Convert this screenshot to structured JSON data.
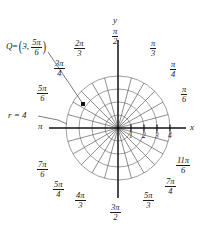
{
  "figure": {
    "type": "polar-grid-diagram",
    "background": "#ffffff",
    "ink_color": "#1a1a1a",
    "grid_color": "#6f6f6f",
    "center": {
      "x": 118,
      "y": 128
    },
    "outer_radius_px": 52,
    "ring_count": 4,
    "ring_radii_units": [
      1,
      2,
      3,
      4
    ],
    "ray_count": 24,
    "ray_step_degrees": 15
  },
  "axes": {
    "x_letter": "x",
    "y_letter": "y",
    "x_ticks": [
      "1",
      "2",
      "3",
      "4"
    ],
    "x_tick_values": [
      1,
      2,
      3,
      4
    ]
  },
  "angle_labels": [
    {
      "name": "pi-over-2",
      "num": "π",
      "den": "2",
      "deg": 90,
      "whole": null
    },
    {
      "name": "pi-over-3",
      "num": "π",
      "den": "3",
      "deg": 60,
      "whole": null
    },
    {
      "name": "pi-over-4",
      "num": "π",
      "den": "4",
      "deg": 45,
      "whole": null
    },
    {
      "name": "pi-over-6",
      "num": "π",
      "den": "6",
      "deg": 30,
      "whole": null
    },
    {
      "name": "two-pi-over-3",
      "num": "2π",
      "den": "3",
      "deg": 120,
      "whole": null
    },
    {
      "name": "three-pi-over-4",
      "num": "3π",
      "den": "4",
      "deg": 135,
      "whole": null
    },
    {
      "name": "five-pi-over-6",
      "num": "5π",
      "den": "6",
      "deg": 150,
      "whole": null
    },
    {
      "name": "pi",
      "num": null,
      "den": null,
      "deg": 180,
      "whole": "π"
    },
    {
      "name": "seven-pi-over-6",
      "num": "7π",
      "den": "6",
      "deg": 210,
      "whole": null
    },
    {
      "name": "five-pi-over-4",
      "num": "5π",
      "den": "4",
      "deg": 225,
      "whole": null
    },
    {
      "name": "four-pi-over-3",
      "num": "4π",
      "den": "3",
      "deg": 240,
      "whole": null
    },
    {
      "name": "three-pi-over-2",
      "num": "3π",
      "den": "2",
      "deg": 270,
      "whole": null
    },
    {
      "name": "five-pi-over-3",
      "num": "5π",
      "den": "3",
      "deg": 300,
      "whole": null
    },
    {
      "name": "seven-pi-over-4",
      "num": "7π",
      "den": "4",
      "deg": 315,
      "whole": null
    },
    {
      "name": "eleven-pi-over-6",
      "num": "11π",
      "den": "6",
      "deg": 330,
      "whole": null
    }
  ],
  "annotations": {
    "point": {
      "name": "Q",
      "equals": "=",
      "r": "3",
      "comma": ",",
      "theta_num": "5π",
      "theta_den": "6",
      "r_value": 3,
      "theta_degrees": 150
    },
    "radius_callout": {
      "text": "r = 4",
      "value": 4
    }
  }
}
